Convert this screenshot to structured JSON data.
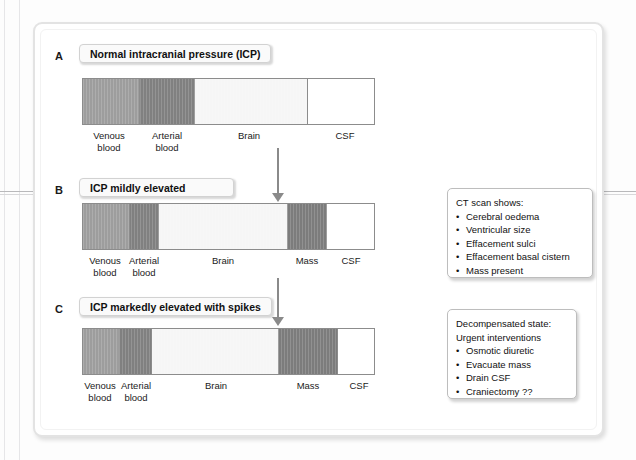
{
  "figure": {
    "panels": [
      {
        "letter": "A",
        "title": "Normal intracranial pressure (ICP)",
        "segments": [
          {
            "name": "venous",
            "label": "Venous\nblood",
            "color": "#9d9d9d"
          },
          {
            "name": "arterial",
            "label": "Arterial\nblood",
            "color": "#808080"
          },
          {
            "name": "brain",
            "label": "Brain",
            "color": "#f6f6f6"
          },
          {
            "name": "csf",
            "label": "CSF",
            "color": "#ffffff"
          }
        ]
      },
      {
        "letter": "B",
        "title": "ICP mildly elevated",
        "segments": [
          {
            "name": "venous",
            "label": "Venous\nblood",
            "color": "#9d9d9d"
          },
          {
            "name": "arterial",
            "label": "Arterial\nblood",
            "color": "#808080"
          },
          {
            "name": "brain",
            "label": "Brain",
            "color": "#f6f6f6"
          },
          {
            "name": "mass",
            "label": "Mass",
            "color": "#7c7c7c"
          },
          {
            "name": "csf",
            "label": "CSF",
            "color": "#ffffff"
          }
        ]
      },
      {
        "letter": "C",
        "title": "ICP markedly elevated with spikes",
        "segments": [
          {
            "name": "venous",
            "label": "Venous\nblood",
            "color": "#9d9d9d"
          },
          {
            "name": "arterial",
            "label": "Arterial\nblood",
            "color": "#808080"
          },
          {
            "name": "brain",
            "label": "Brain",
            "color": "#f6f6f6"
          },
          {
            "name": "mass",
            "label": "Mass",
            "color": "#7c7c7c"
          },
          {
            "name": "csf",
            "label": "CSF",
            "color": "#ffffff"
          }
        ]
      }
    ],
    "notes": [
      {
        "name": "ct-findings",
        "lines": [
          {
            "text": "CT scan shows:",
            "bullet": false
          },
          {
            "text": "Cerebral oedema",
            "bullet": true
          },
          {
            "text": "Ventricular size",
            "bullet": true
          },
          {
            "text": "Effacement sulci",
            "bullet": true
          },
          {
            "text": "Effacement basal cistern",
            "bullet": true
          },
          {
            "text": "Mass present",
            "bullet": true
          }
        ]
      },
      {
        "name": "decompensated-management",
        "lines": [
          {
            "text": "Decompensated state:",
            "bullet": false
          },
          {
            "text": "Urgent interventions",
            "bullet": false
          },
          {
            "text": "Osmotic diuretic",
            "bullet": true
          },
          {
            "text": "Evacuate mass",
            "bullet": true
          },
          {
            "text": "Drain CSF",
            "bullet": true
          },
          {
            "text": "Craniectomy ??",
            "bullet": true
          }
        ]
      }
    ],
    "arrows": [
      {
        "name": "arrow-a-to-b"
      },
      {
        "name": "arrow-b-to-c"
      }
    ],
    "colors": {
      "venous_blood": "#9d9d9d",
      "arterial_blood": "#808080",
      "brain": "#f6f6f6",
      "mass": "#7c7c7c",
      "csf": "#ffffff",
      "bar_outline": "#8c8c8c",
      "frame": "#e3e3e3"
    }
  }
}
